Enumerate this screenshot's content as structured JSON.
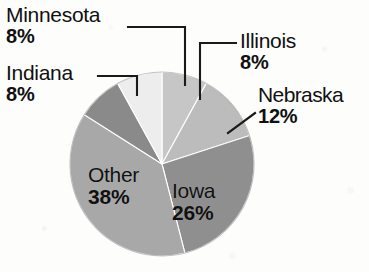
{
  "chart_data": {
    "type": "pie",
    "title": "",
    "subtitle": "",
    "xlabel": "",
    "ylabel": "",
    "legend_position": "none",
    "grid": false,
    "unit": "%",
    "start_angle_deg": 0,
    "direction": "clockwise",
    "categories": [
      "Illinois",
      "Nebraska",
      "Iowa",
      "Other",
      "Indiana",
      "Minnesota"
    ],
    "values": [
      8,
      12,
      26,
      38,
      8,
      8
    ],
    "slices": [
      {
        "label": "Illinois",
        "value": 8,
        "display_value": "8%",
        "color": "#c6c6c6",
        "label_placement": "outside-right",
        "leader_line": true
      },
      {
        "label": "Nebraska",
        "value": 12,
        "display_value": "12%",
        "color": "#bcbcbc",
        "label_placement": "outside-right",
        "leader_line": true
      },
      {
        "label": "Iowa",
        "value": 26,
        "display_value": "26%",
        "color": "#8f8f8f",
        "label_placement": "inside",
        "leader_line": false
      },
      {
        "label": "Other",
        "value": 38,
        "display_value": "38%",
        "color": "#a8a8a8",
        "label_placement": "inside",
        "leader_line": false
      },
      {
        "label": "Indiana",
        "value": 8,
        "display_value": "8%",
        "color": "#8a8a8a",
        "label_placement": "outside-left",
        "leader_line": true
      },
      {
        "label": "Minnesota",
        "value": 8,
        "display_value": "8%",
        "color": "#ededed",
        "label_placement": "outside-left",
        "leader_line": true
      }
    ]
  },
  "labels": {
    "minnesota": {
      "name": "Minnesota",
      "pct": "8%"
    },
    "indiana": {
      "name": "Indiana",
      "pct": "8%"
    },
    "illinois": {
      "name": "Illinois",
      "pct": "8%"
    },
    "nebraska": {
      "name": "Nebraska",
      "pct": "12%"
    },
    "other": {
      "name": "Other",
      "pct": "38%"
    },
    "iowa": {
      "name": "Iowa",
      "pct": "26%"
    }
  },
  "style": {
    "background": "#fdfdfc",
    "text_color": "#101010",
    "leader_line_color": "#1a1a1a"
  }
}
